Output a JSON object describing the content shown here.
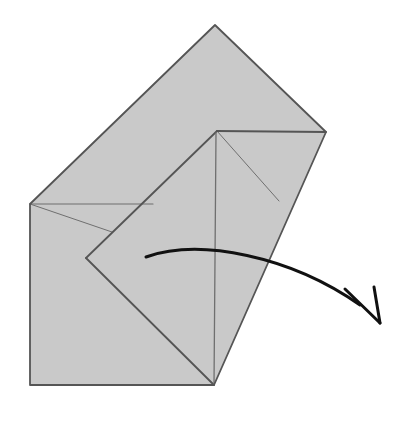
{
  "figure": {
    "kind": "origami-fold-diagram",
    "canvas": {
      "width": 408,
      "height": 421,
      "background": "#ffffff"
    },
    "colors": {
      "paper_fill": "#c9c9c9",
      "outline_stroke": "#555555",
      "fold_line_stroke": "#6f6f6f",
      "arrow_stroke": "#111111"
    },
    "strokes": {
      "outline_width": 1.8,
      "fold_line_width": 1.1,
      "arrow_width": 3.0
    },
    "shapes": {
      "paper_outline": {
        "label": "folded paper silhouette",
        "points": "30,204 215,25 326,132 214,385 30,385"
      },
      "inner_flap": {
        "label": "folded-over triangular flap",
        "points": "217,131 86,258 214,385"
      }
    },
    "fold_lines": [
      {
        "name": "top-left-horizontal-crease",
        "d": "M 30,204 L 153,204"
      },
      {
        "name": "inner-top-edge-crease",
        "d": "M 217,131 L 326,132"
      },
      {
        "name": "flap-upper-diagonal-crease",
        "d": "M 217,131 L 86,258"
      },
      {
        "name": "flap-lower-diagonal-crease",
        "d": "M 86,258 L 214,385"
      },
      {
        "name": "flap-center-vertical-crease",
        "d": "M 216,133 L 214,385"
      },
      {
        "name": "right-thin-diagonal-crease",
        "d": "M 217,131 L 279,201"
      },
      {
        "name": "left-thin-diagonal-crease",
        "d": "M 30,204 L 112,232"
      }
    ],
    "arrow": {
      "name": "fold-direction-arrow",
      "description": "curved arrow sweeping right and down, indicating the flap unfolds outward",
      "curve_d": "M 146,257 C 200,238 290,256 360,305",
      "head_left_d": "M 345,289 L 380,323",
      "head_right_d": "M 374,287 L 380,323",
      "tip": {
        "x": 380,
        "y": 323
      },
      "tail": {
        "x": 146,
        "y": 257
      }
    }
  }
}
